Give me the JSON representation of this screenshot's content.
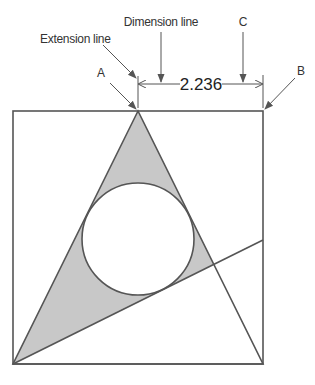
{
  "diagram": {
    "labels": {
      "extension_line": "Extension line",
      "dimension_line": "Dimension line",
      "a": "A",
      "b": "B",
      "c": "C"
    },
    "dimension_value": "2.236",
    "colors": {
      "stroke": "#555555",
      "fill": "#c8c8c8",
      "background": "#ffffff"
    },
    "geometry": {
      "square": {
        "x": 13,
        "y": 111,
        "width": 250,
        "height": 253
      },
      "triangle": {
        "apex": [
          138,
          111
        ],
        "base_left": [
          13,
          364
        ],
        "base_right": [
          263,
          364
        ]
      },
      "circle": {
        "cx": 138,
        "cy": 239,
        "r": 56
      },
      "diagonal": {
        "from": [
          13,
          364
        ],
        "to": [
          263,
          240
        ]
      }
    }
  }
}
